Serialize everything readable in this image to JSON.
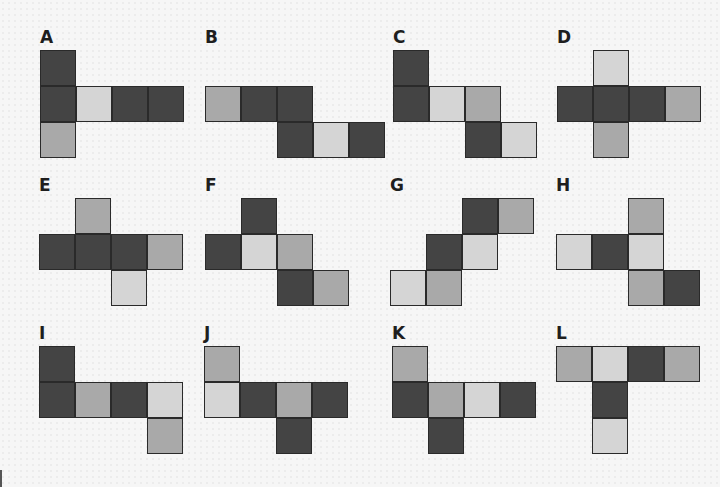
{
  "cell_size": 36,
  "shades": {
    "D": "#444444",
    "M": "#a9a9a9",
    "L": "#d5d5d5"
  },
  "nets": [
    {
      "label": "A",
      "x": 40,
      "y": 29,
      "cells": [
        [
          0,
          0,
          "D"
        ],
        [
          1,
          0,
          "D"
        ],
        [
          1,
          1,
          "L"
        ],
        [
          1,
          2,
          "D"
        ],
        [
          1,
          3,
          "D"
        ],
        [
          2,
          0,
          "M"
        ]
      ]
    },
    {
      "label": "B",
      "x": 205,
      "y": 29,
      "cells": [
        [
          1,
          0,
          "M"
        ],
        [
          1,
          1,
          "D"
        ],
        [
          1,
          2,
          "D"
        ],
        [
          2,
          2,
          "D"
        ],
        [
          2,
          3,
          "L"
        ],
        [
          2,
          4,
          "D"
        ]
      ]
    },
    {
      "label": "C",
      "x": 393,
      "y": 29,
      "cells": [
        [
          0,
          0,
          "D"
        ],
        [
          1,
          0,
          "D"
        ],
        [
          1,
          1,
          "L"
        ],
        [
          1,
          2,
          "M"
        ],
        [
          2,
          2,
          "D"
        ],
        [
          2,
          3,
          "L"
        ]
      ]
    },
    {
      "label": "D",
      "x": 557,
      "y": 29,
      "cells": [
        [
          0,
          1,
          "L"
        ],
        [
          1,
          0,
          "D"
        ],
        [
          1,
          1,
          "D"
        ],
        [
          1,
          2,
          "D"
        ],
        [
          1,
          3,
          "M"
        ],
        [
          2,
          1,
          "M"
        ]
      ]
    },
    {
      "label": "E",
      "x": 39,
      "y": 177,
      "cells": [
        [
          0,
          1,
          "M"
        ],
        [
          1,
          0,
          "D"
        ],
        [
          1,
          1,
          "D"
        ],
        [
          1,
          2,
          "D"
        ],
        [
          1,
          3,
          "M"
        ],
        [
          2,
          2,
          "L"
        ]
      ]
    },
    {
      "label": "F",
      "x": 205,
      "y": 177,
      "cells": [
        [
          0,
          1,
          "D"
        ],
        [
          1,
          0,
          "D"
        ],
        [
          1,
          1,
          "L"
        ],
        [
          1,
          2,
          "M"
        ],
        [
          2,
          2,
          "D"
        ],
        [
          2,
          3,
          "M"
        ]
      ]
    },
    {
      "label": "G",
      "x": 390,
      "y": 177,
      "cells": [
        [
          0,
          2,
          "D"
        ],
        [
          0,
          3,
          "M"
        ],
        [
          1,
          1,
          "D"
        ],
        [
          1,
          2,
          "L"
        ],
        [
          2,
          0,
          "L"
        ],
        [
          2,
          1,
          "M"
        ]
      ]
    },
    {
      "label": "H",
      "x": 556,
      "y": 177,
      "cells": [
        [
          0,
          2,
          "M"
        ],
        [
          1,
          0,
          "L"
        ],
        [
          1,
          1,
          "D"
        ],
        [
          1,
          2,
          "L"
        ],
        [
          2,
          2,
          "M"
        ],
        [
          2,
          3,
          "D"
        ]
      ]
    },
    {
      "label": "I",
      "x": 39,
      "y": 325,
      "cells": [
        [
          0,
          0,
          "D"
        ],
        [
          1,
          0,
          "D"
        ],
        [
          1,
          1,
          "M"
        ],
        [
          1,
          2,
          "D"
        ],
        [
          1,
          3,
          "L"
        ],
        [
          2,
          3,
          "M"
        ]
      ]
    },
    {
      "label": "J",
      "x": 204,
      "y": 325,
      "cells": [
        [
          0,
          0,
          "M"
        ],
        [
          1,
          0,
          "L"
        ],
        [
          1,
          1,
          "D"
        ],
        [
          1,
          2,
          "M"
        ],
        [
          1,
          3,
          "D"
        ],
        [
          2,
          2,
          "D"
        ]
      ]
    },
    {
      "label": "K",
      "x": 392,
      "y": 325,
      "cells": [
        [
          0,
          0,
          "M"
        ],
        [
          1,
          0,
          "D"
        ],
        [
          1,
          1,
          "M"
        ],
        [
          1,
          2,
          "L"
        ],
        [
          1,
          3,
          "D"
        ],
        [
          2,
          1,
          "D"
        ]
      ]
    },
    {
      "label": "L",
      "x": 556,
      "y": 325,
      "cells": [
        [
          0,
          0,
          "M"
        ],
        [
          0,
          1,
          "L"
        ],
        [
          0,
          2,
          "D"
        ],
        [
          0,
          3,
          "M"
        ],
        [
          1,
          1,
          "D"
        ],
        [
          2,
          1,
          "L"
        ]
      ]
    }
  ]
}
